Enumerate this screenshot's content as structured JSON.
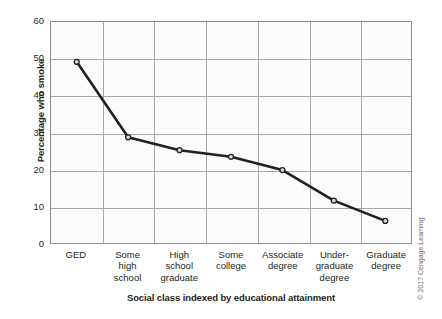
{
  "chart_data": {
    "type": "line",
    "title": "",
    "xlabel": "Social class indexed by educational attainment",
    "ylabel": "Percentage who smoke",
    "categories": [
      "GED",
      "Some high school",
      "High school graduate",
      "Some college",
      "Associate degree",
      "Under-graduate degree",
      "Graduate degree"
    ],
    "category_lines": [
      [
        "GED"
      ],
      [
        "Some",
        "high",
        "school"
      ],
      [
        "High",
        "school",
        "graduate"
      ],
      [
        "Some",
        "college"
      ],
      [
        "Associate",
        "degree"
      ],
      [
        "Under-",
        "graduate",
        "degree"
      ],
      [
        "Graduate",
        "degree"
      ]
    ],
    "values": [
      49.2,
      28.7,
      25.2,
      23.4,
      19.8,
      11.5,
      6.0
    ],
    "series": [
      {
        "name": "Percentage who smoke",
        "values": [
          49.2,
          28.7,
          25.2,
          23.4,
          19.8,
          11.5,
          6.0
        ]
      }
    ],
    "ylim": [
      0,
      60
    ],
    "yticks": [
      0,
      10,
      20,
      30,
      40,
      50,
      60
    ],
    "ytick_labels": [
      "0",
      "10",
      "20",
      "30",
      "40",
      "50",
      "60"
    ],
    "grid": "both",
    "legend": "none",
    "line_color": "#231f20",
    "marker_face_color": "#d9d9d9",
    "marker_edge_color": "#231f20",
    "plot_background": "#fbfbfb",
    "grid_color": "#a6a6a6",
    "axis_color": "#8e8e8e"
  },
  "credit": {
    "text": "© 2017 Cengage Learning"
  }
}
